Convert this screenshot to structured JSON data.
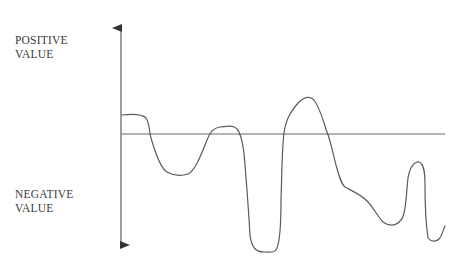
{
  "labels": {
    "positive": {
      "line1": "POSITIVE",
      "line2": "VALUE"
    },
    "negative": {
      "line1": "NEGATIVE",
      "line2": "VALUE"
    }
  },
  "colors": {
    "axis": "#6a6a6a",
    "curve": "#5a5a5a",
    "text": "#3a3a3a",
    "background": "#ffffff"
  },
  "diagram": {
    "type": "waveform",
    "vertical_axis": {
      "x": 121,
      "y_top": 17,
      "y_bottom": 255,
      "arrows": "both"
    },
    "baseline": {
      "y": 134,
      "x_start": 121,
      "x_end": 445
    },
    "curve_description": "Irregular wave oscillating above and below a horizontal zero baseline"
  }
}
